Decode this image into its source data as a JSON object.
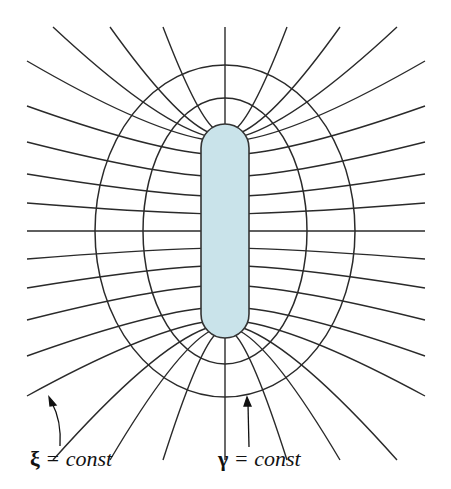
{
  "figure": {
    "rod_fill": "#c9e3ea",
    "rod_stroke": "#333333",
    "line_color": "#2a2a2a",
    "rod": {
      "cx": 225,
      "cy": 231,
      "half_straight": 83,
      "radius": 24
    },
    "ellipses": [
      {
        "name": "inner",
        "rx": 82,
        "ry": 133
      },
      {
        "name": "outer",
        "rx": 130,
        "ry": 166
      }
    ],
    "ray_count_per_side": 12
  },
  "labels": {
    "xi": {
      "symbol": "ξ",
      "text": " = const"
    },
    "gamma": {
      "symbol": "γ",
      "text": " = const"
    }
  }
}
